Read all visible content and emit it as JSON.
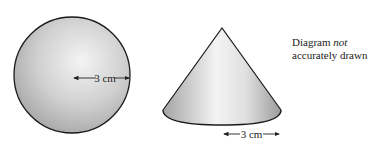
{
  "diagram": {
    "sphere": {
      "radius_label": "3 cm",
      "fill_light": "#f2f2f2",
      "fill_dark": "#a8a8a8",
      "outline": "#1a1a1a"
    },
    "cone": {
      "radius_label": "3 cm",
      "fill_light": "#f6f6f6",
      "fill_dark": "#9a9a9a",
      "outline": "#1a1a1a"
    },
    "note": {
      "line1_prefix": "Diagram ",
      "line1_emphasis": "not",
      "line2": "accurately drawn"
    }
  }
}
